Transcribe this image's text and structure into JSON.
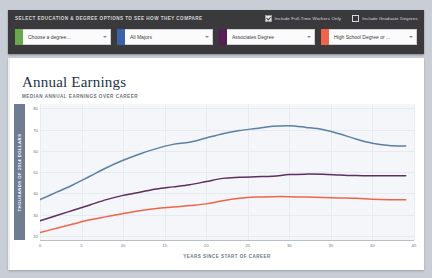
{
  "control_bar": {
    "title": "SELECT EDUCATION & DEGREE OPTIONS TO SEE HOW THEY COMPARE",
    "checkboxes": [
      {
        "label": "Include Full-Time Workers Only",
        "checked": true,
        "style": "check"
      },
      {
        "label": "Include Graduate Degrees",
        "checked": true,
        "style": "filled"
      }
    ],
    "selectors": [
      {
        "value": "Choose a degree...",
        "color": "#6aa84f",
        "name": "degree-select"
      },
      {
        "value": "All Majors",
        "color": "#3a62a8",
        "name": "major-select"
      },
      {
        "value": "Associates Degree",
        "color": "#5b1b56",
        "name": "associates-select"
      },
      {
        "value": "High School Degree or ...",
        "color": "#f0654a",
        "name": "highschool-select"
      }
    ]
  },
  "chart_card": {
    "title": "Annual Earnings",
    "subtitle": "MEDIAN ANNUAL EARNINGS OVER CAREER"
  },
  "chart_data": {
    "type": "line",
    "title": "Annual Earnings",
    "subtitle": "MEDIAN ANNUAL EARNINGS OVER CAREER",
    "xlabel": "YEARS SINCE START OF CAREER",
    "ylabel": "THOUSANDS OF 2014 DOLLARS",
    "xlim": [
      0,
      45
    ],
    "ylim": [
      18,
      82
    ],
    "xticks": [
      0,
      5,
      10,
      15,
      20,
      25,
      30,
      35,
      40,
      45
    ],
    "yticks": [
      20,
      30,
      40,
      50,
      60,
      70,
      80
    ],
    "grid": true,
    "legend": "none",
    "x": [
      0,
      2,
      4,
      6,
      8,
      10,
      12,
      14,
      16,
      18,
      20,
      22,
      24,
      26,
      28,
      30,
      32,
      34,
      36,
      38,
      40,
      42,
      44
    ],
    "series": [
      {
        "name": "All Majors (Bachelors)",
        "color": "#5b7fa6",
        "values": [
          37.0,
          40.5,
          44.0,
          48.0,
          52.0,
          55.5,
          58.5,
          61.0,
          63.0,
          64.0,
          66.0,
          68.0,
          69.5,
          70.5,
          71.5,
          71.8,
          71.0,
          70.0,
          68.0,
          65.5,
          63.5,
          62.5,
          62.2
        ]
      },
      {
        "name": "Associates Degree",
        "color": "#5b2f5e",
        "values": [
          27.0,
          29.5,
          32.0,
          34.5,
          37.0,
          39.0,
          40.5,
          42.0,
          43.0,
          44.0,
          45.5,
          47.0,
          47.5,
          47.8,
          48.0,
          48.8,
          49.0,
          48.9,
          48.6,
          48.3,
          48.2,
          48.2,
          48.2
        ]
      },
      {
        "name": "High School Degree or Less",
        "color": "#f0654a",
        "values": [
          21.5,
          23.5,
          25.5,
          27.5,
          29.0,
          30.5,
          31.8,
          32.8,
          33.5,
          34.2,
          35.0,
          36.5,
          37.6,
          38.2,
          38.4,
          38.4,
          38.2,
          38.0,
          37.8,
          37.6,
          37.2,
          37.0,
          37.0
        ]
      }
    ]
  }
}
